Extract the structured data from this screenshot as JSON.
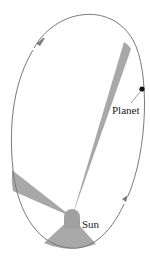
{
  "diagram": {
    "type": "kepler-second-law-orbit",
    "labels": {
      "planet": "Planet",
      "sun": "Sun"
    },
    "colors": {
      "orbit": "#7a7a7a",
      "sector": "#a8a8a8",
      "sun": "#a0a0a0",
      "planet": "#111111",
      "background": "#ffffff"
    },
    "arrows": [
      {
        "name": "direction-arrow-top-left",
        "direction": "counterclockwise"
      },
      {
        "name": "direction-arrow-bottom-right",
        "direction": "counterclockwise"
      }
    ],
    "sectors": [
      {
        "name": "thin-sector-far",
        "description": "narrow swept area near aphelion"
      },
      {
        "name": "medium-sector-side",
        "description": "swept area on left side"
      },
      {
        "name": "wide-sector-near",
        "description": "wide swept area near perihelion"
      }
    ]
  }
}
